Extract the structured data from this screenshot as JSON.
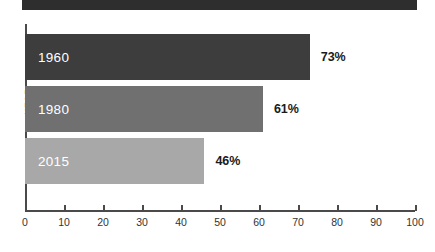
{
  "chart_data": {
    "type": "bar",
    "orientation": "horizontal",
    "title": "SHARE OF ADULTS WHO HAVE EVER BEEN MARRIED",
    "xlabel": "",
    "ylabel": "YEAR",
    "categories": [
      "1960",
      "1980",
      "2015"
    ],
    "values": [
      73,
      61,
      46
    ],
    "value_labels": [
      "73%",
      "61%",
      "46%"
    ],
    "xlim": [
      0,
      100
    ],
    "xticks": [
      0,
      10,
      20,
      30,
      40,
      50,
      60,
      70,
      80,
      90,
      100
    ],
    "xtick_labels": [
      "0",
      "10",
      "20",
      "30",
      "40",
      "50",
      "60",
      "70",
      "80",
      "90",
      "100"
    ],
    "grid": false,
    "legend": "none",
    "series_colors": [
      "#3d3d3d",
      "#707070",
      "#a8a8a8"
    ],
    "title_background": "#2e2e2e",
    "title_color": "#ffffff",
    "axis_color": "#4a4a4a"
  }
}
